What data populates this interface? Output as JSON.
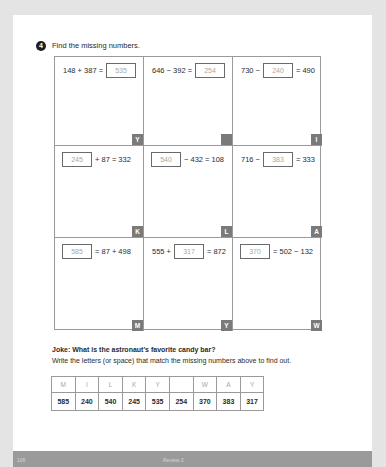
{
  "question": {
    "number": "4",
    "prompt": "Find the missing numbers."
  },
  "grid": [
    {
      "before": "148 + 387 =",
      "answer": "535",
      "after": "",
      "letter": "Y"
    },
    {
      "before": "646 − 392 =",
      "answer": "254",
      "after": "",
      "letter": ""
    },
    {
      "before": "730 −",
      "answer": "240",
      "after": "= 490",
      "letter": "I"
    },
    {
      "before": "",
      "answer": "245",
      "after": "+ 87 = 332",
      "letter": "K"
    },
    {
      "before": "",
      "answer": "540",
      "after": "− 432 = 108",
      "letter": "L"
    },
    {
      "before": "716 −",
      "answer": "383",
      "after": "= 333",
      "letter": "A"
    },
    {
      "before": "",
      "answer": "585",
      "after": "= 87 + 498",
      "letter": "M"
    },
    {
      "before": "555 +",
      "answer": "317",
      "after": "= 872",
      "letter": "Y"
    },
    {
      "before": "",
      "answer": "370",
      "after": "= 502 − 132",
      "letter": "W"
    }
  ],
  "joke": {
    "title": "Joke: What is the astronaut's favorite candy bar?",
    "instruction": "Write the letters (or space) that match the missing numbers above to find out."
  },
  "answer_table": {
    "letters": [
      "M",
      "I",
      "L",
      "K",
      "Y",
      "",
      "W",
      "A",
      "Y"
    ],
    "numbers": [
      "585",
      "240",
      "540",
      "245",
      "535",
      "254",
      "370",
      "383",
      "317"
    ]
  },
  "footer": {
    "page_number": "106",
    "section": "Review 3"
  }
}
